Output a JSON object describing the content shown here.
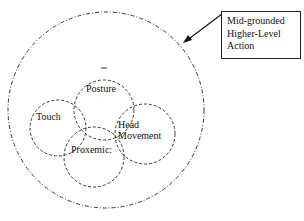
{
  "diagram": {
    "outer_circle": {
      "label": "Mid-grounded Higher-Level Action"
    },
    "callout": {
      "lines": [
        "Mid-grounded",
        "Higher-Level",
        "Action"
      ]
    },
    "inner_circles": [
      {
        "name": "posture",
        "label": "Posture"
      },
      {
        "name": "touch",
        "label": "Touch"
      },
      {
        "name": "head-movement",
        "label_lines": [
          "Head",
          "Movement"
        ]
      },
      {
        "name": "proxemics",
        "label": "Proxemic:"
      }
    ]
  }
}
